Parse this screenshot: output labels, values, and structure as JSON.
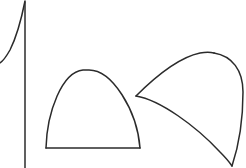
{
  "canvas": {
    "width": 246,
    "height": 168,
    "background_color": "#ffffff",
    "ink_color": "#2b2b2b",
    "stroke_width": 1.5
  },
  "diagram": {
    "type": "line-drawing",
    "shapes": [
      {
        "name": "asymptote-figure",
        "label": "",
        "parts": [
          {
            "name": "vertical-axis-line",
            "kind": "line",
            "path": "M 25 2 L 25 168"
          },
          {
            "name": "asymptotic-curve",
            "kind": "curve",
            "path": "M 25 1 C 22 16 17 36 10 50 C 6 57 3 61 0 63"
          }
        ]
      },
      {
        "name": "dome-figure",
        "label": "",
        "parts": [
          {
            "name": "dome-arc",
            "kind": "curve",
            "path": "M 46 148 C 47 112 62 72 83 70 C 84 70 88 70 89 70 C 112 70 137 110 140 148"
          },
          {
            "name": "dome-baseline",
            "kind": "line",
            "path": "M 46 148 L 140 148"
          }
        ]
      },
      {
        "name": "sail-figure",
        "label": "",
        "parts": [
          {
            "name": "sail-upper-curve",
            "kind": "curve",
            "path": "M 136 96 C 152 80 176 58 200 53 C 206 52 210 52 214 53"
          },
          {
            "name": "sail-right-curve",
            "kind": "curve",
            "path": "M 214 53 C 232 56 243 70 243 92 C 243 120 238 148 232 166"
          },
          {
            "name": "sail-lower-curve",
            "kind": "curve",
            "path": "M 136 96 C 160 100 196 126 220 152 C 226 158 230 163 232 166"
          }
        ]
      }
    ]
  }
}
